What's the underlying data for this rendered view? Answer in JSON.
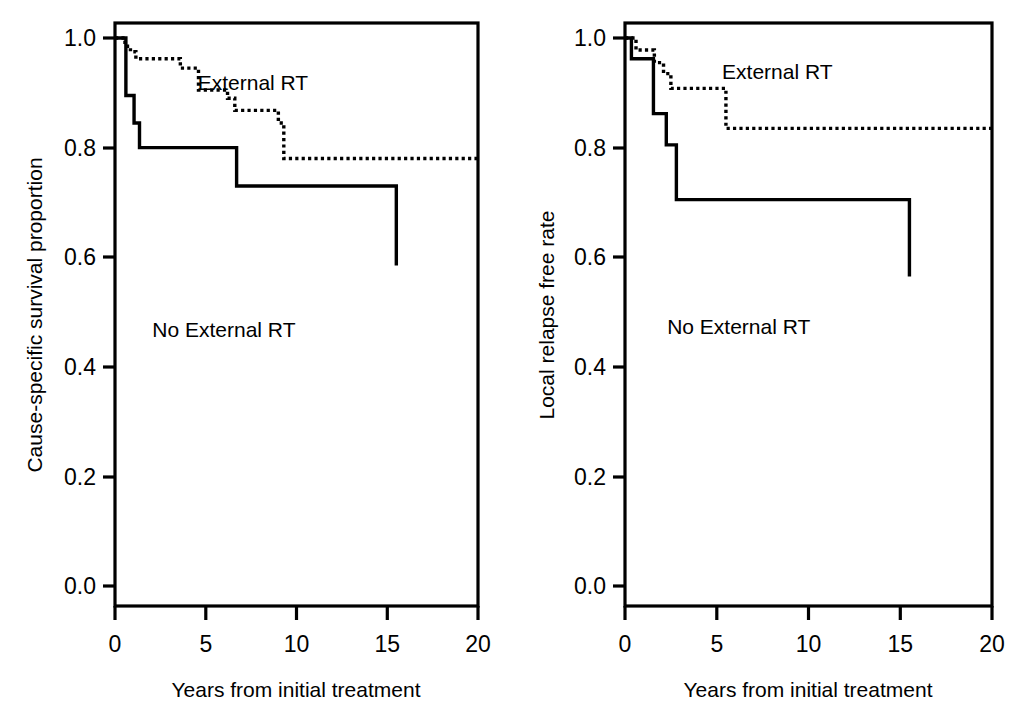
{
  "figure": {
    "type": "kaplan-meier-figure",
    "panel_count": 2,
    "background_color": "#ffffff",
    "line_color": "#000000"
  },
  "panels": [
    {
      "id": "left",
      "ylabel": "Cause-specific survival proportion",
      "xlabel": "Years from initial treatment",
      "series_label_external": "External RT",
      "series_label_no_external": "No External RT",
      "xticks": [
        "0",
        "5",
        "10",
        "15",
        "20"
      ],
      "yticks": [
        "0.0",
        "0.2",
        "0.4",
        "0.6",
        "0.8",
        "1.0"
      ]
    },
    {
      "id": "right",
      "ylabel": "Local relapse free rate",
      "xlabel": "Years from initial treatment",
      "series_label_external": "External RT",
      "series_label_no_external": "No External RT",
      "xticks": [
        "0",
        "5",
        "10",
        "15",
        "20"
      ],
      "yticks": [
        "0.0",
        "0.2",
        "0.4",
        "0.6",
        "0.8",
        "1.0"
      ]
    }
  ],
  "chart_data": [
    {
      "type": "line",
      "subtype": "kaplan-meier-step",
      "title": "",
      "panel": "left",
      "xlabel": "Years from initial treatment",
      "ylabel": "Cause-specific survival proportion",
      "xlim": [
        0,
        20
      ],
      "ylim": [
        0.0,
        1.0
      ],
      "xticks": [
        0,
        5,
        10,
        15,
        20
      ],
      "yticks": [
        0.0,
        0.2,
        0.4,
        0.6,
        0.8,
        1.0
      ],
      "grid": false,
      "legend": "inline-annotation",
      "series": [
        {
          "name": "External RT",
          "linestyle": "dotted",
          "color": "#000000",
          "label_position": {
            "x": 7.6,
            "y": 0.905
          },
          "x": [
            0.0,
            0.25,
            0.55,
            0.85,
            1.15,
            3.2,
            3.6,
            4.3,
            4.6,
            5.6,
            6.2,
            6.6,
            8.1,
            9.0,
            9.3,
            20.0
          ],
          "y": [
            1.0,
            1.0,
            0.985,
            0.975,
            0.962,
            0.962,
            0.945,
            0.945,
            0.905,
            0.905,
            0.89,
            0.868,
            0.868,
            0.845,
            0.78,
            0.78
          ]
        },
        {
          "name": "No External RT",
          "linestyle": "solid",
          "color": "#000000",
          "label_position": {
            "x": 6.0,
            "y": 0.455
          },
          "x": [
            0.0,
            0.35,
            0.6,
            1.05,
            1.35,
            2.45,
            6.7,
            15.5
          ],
          "y": [
            1.0,
            1.0,
            0.895,
            0.845,
            0.8,
            0.8,
            0.73,
            0.585
          ]
        }
      ]
    },
    {
      "type": "line",
      "subtype": "kaplan-meier-step",
      "title": "",
      "panel": "right",
      "xlabel": "Years from initial treatment",
      "ylabel": "Local relapse free rate",
      "xlim": [
        0,
        20
      ],
      "ylim": [
        0.0,
        1.0
      ],
      "xticks": [
        0,
        5,
        10,
        15,
        20
      ],
      "yticks": [
        0.0,
        0.2,
        0.4,
        0.6,
        0.8,
        1.0
      ],
      "grid": false,
      "legend": "inline-annotation",
      "series": [
        {
          "name": "External RT",
          "linestyle": "dotted",
          "color": "#000000",
          "label_position": {
            "x": 8.3,
            "y": 0.925
          },
          "x": [
            0.0,
            0.3,
            0.6,
            1.2,
            1.6,
            2.1,
            2.5,
            3.0,
            5.1,
            5.5,
            20.0
          ],
          "y": [
            1.0,
            1.0,
            0.978,
            0.978,
            0.955,
            0.935,
            0.908,
            0.908,
            0.908,
            0.835,
            0.835
          ]
        },
        {
          "name": "No External RT",
          "linestyle": "solid",
          "color": "#000000",
          "label_position": {
            "x": 6.2,
            "y": 0.46
          },
          "x": [
            0.0,
            0.35,
            0.75,
            1.55,
            1.95,
            2.25,
            2.8,
            5.5,
            15.5
          ],
          "y": [
            1.0,
            0.962,
            0.962,
            0.862,
            0.862,
            0.805,
            0.705,
            0.705,
            0.565
          ]
        }
      ]
    }
  ]
}
